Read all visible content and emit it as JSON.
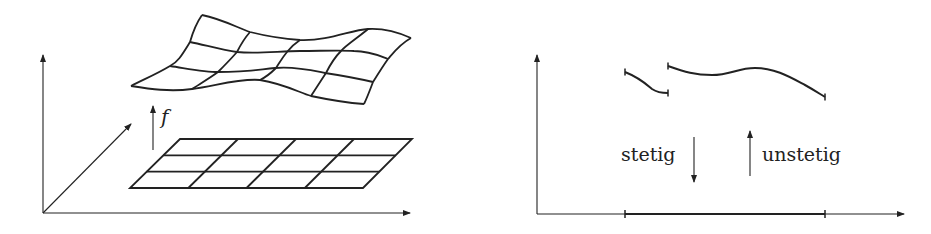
{
  "left_panel": {
    "mapping_label": "f",
    "description": "Flat rectangular 3x4 grid in a plane mapped by f to a warped surface in 3D space"
  },
  "right_panel": {
    "label_continuous": "stetig",
    "label_discontinuous": "unstetig",
    "description": "Graph of a function on an interval with a jump discontinuity"
  },
  "colors": {
    "stroke": "#222222",
    "background": "#ffffff"
  }
}
